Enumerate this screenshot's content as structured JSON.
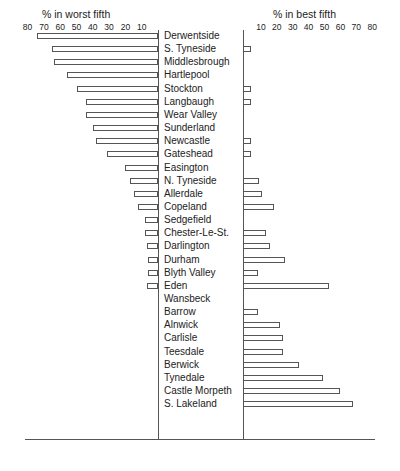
{
  "chart_data": {
    "type": "bar",
    "orientation": "horizontal-diverging",
    "title_left": "% in worst fifth",
    "title_right": "% in best fifth",
    "left_ticks": [
      "80",
      "70",
      "60",
      "50",
      "40",
      "30",
      "20",
      "10"
    ],
    "right_ticks": [
      "10",
      "20",
      "30",
      "40",
      "50",
      "60",
      "70",
      "80"
    ],
    "xlim": [
      0,
      80
    ],
    "categories": [
      "Derwentside",
      "S. Tyneside",
      "Middlesbrough",
      "Hartlepool",
      "Stockton",
      "Langbaugh",
      "Wear Valley",
      "Sunderland",
      "Newcastle",
      "Gateshead",
      "Easington",
      "N. Tyneside",
      "Allerdale",
      "Copeland",
      "Sedgefield",
      "Chester-Le-St.",
      "Darlington",
      "Durham",
      "Blyth Valley",
      "Eden",
      "Wansbeck",
      "Barrow",
      "Alnwick",
      "Carlisle",
      "Teesdale",
      "Berwick",
      "Tynedale",
      "Castle Morpeth",
      "S. Lakeland"
    ],
    "series": [
      {
        "name": "% in worst fifth",
        "values": [
          74,
          65,
          64,
          56,
          50,
          44,
          44,
          40,
          38,
          31,
          20,
          17,
          15,
          12,
          8,
          8,
          7,
          6,
          6,
          7,
          0,
          0,
          0,
          0,
          0,
          0,
          0,
          0,
          0
        ]
      },
      {
        "name": "% in best fifth",
        "values": [
          0,
          4,
          0,
          0,
          4,
          4,
          0,
          0,
          4,
          4,
          0,
          9,
          11,
          18,
          0,
          13,
          16,
          25,
          8,
          53,
          0,
          8,
          22,
          24,
          24,
          34,
          49,
          60,
          68
        ]
      }
    ]
  }
}
